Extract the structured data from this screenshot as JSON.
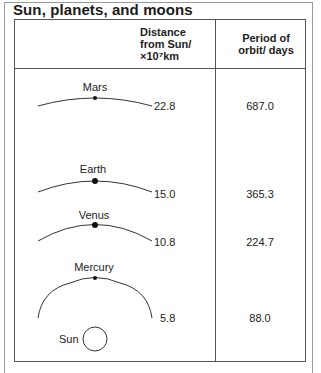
{
  "title": "Sun, planets, and moons",
  "headers": {
    "distance": [
      "Distance",
      "from Sun/",
      "×10⁷km"
    ],
    "period": [
      "Period of",
      "orbit/ days"
    ]
  },
  "planets": [
    {
      "name": "Mars",
      "distance": "22.8",
      "period": "687.0"
    },
    {
      "name": "Earth",
      "distance": "15.0",
      "period": "365.3"
    },
    {
      "name": "Venus",
      "distance": "10.8",
      "period": "224.7"
    },
    {
      "name": "Mercury",
      "distance": "5.8",
      "period": "88.0"
    }
  ],
  "sun_label": "Sun"
}
